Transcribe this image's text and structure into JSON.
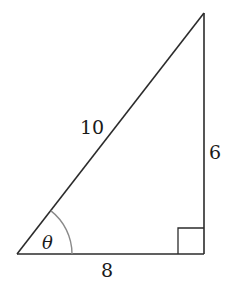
{
  "figure": {
    "type": "right-triangle",
    "vertices": {
      "bottom_left": {
        "x": 17,
        "y": 254
      },
      "bottom_right": {
        "x": 204,
        "y": 254
      },
      "top_right": {
        "x": 204,
        "y": 13
      }
    },
    "labels": {
      "hypotenuse": "10",
      "vertical_leg": "6",
      "horizontal_leg": "8",
      "angle": "θ"
    },
    "right_angle_marker": {
      "corner": "bottom_right",
      "size": 26
    },
    "angle_arc": {
      "vertex": "bottom_left",
      "radius": 55
    },
    "colors": {
      "line": "#2b2b2b",
      "arc": "#8a8a8a",
      "text": "#1a1a1a",
      "background": "#ffffff"
    }
  }
}
